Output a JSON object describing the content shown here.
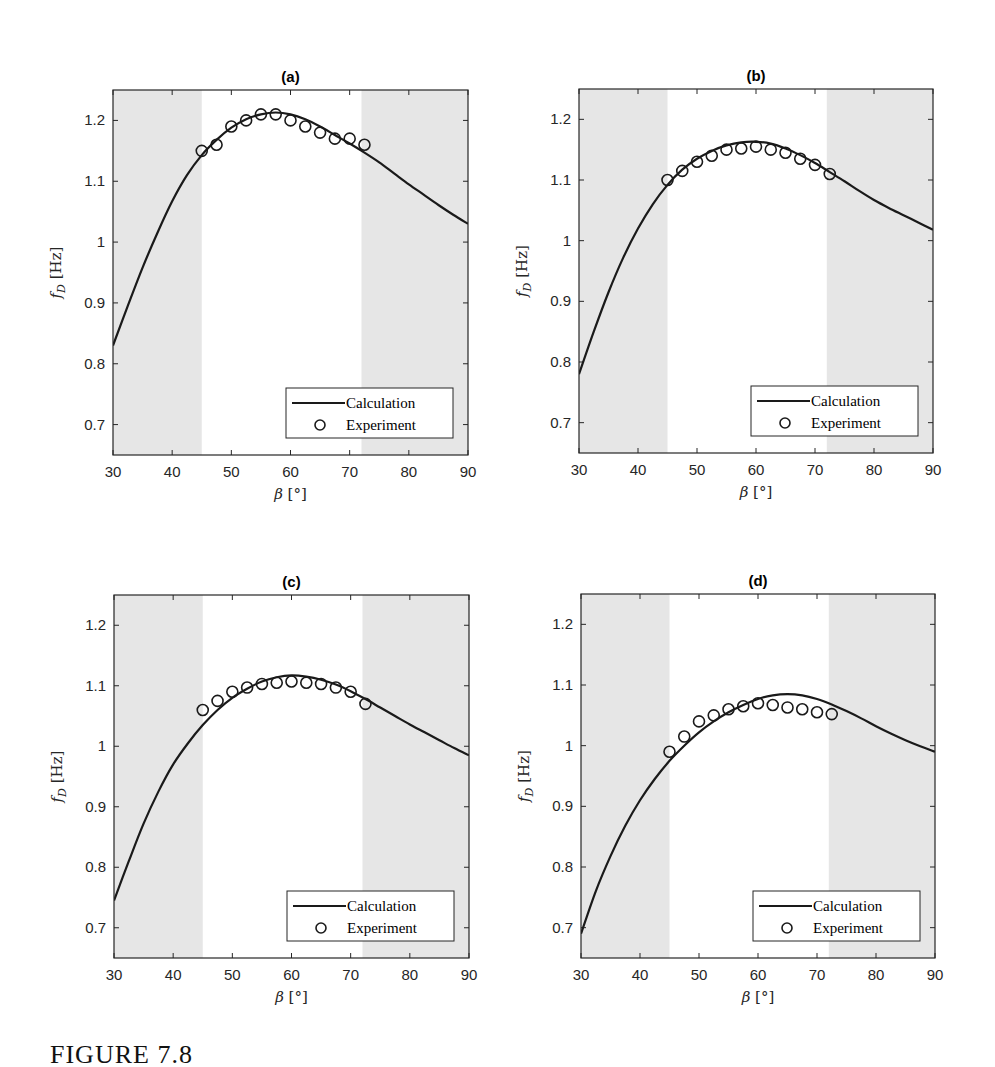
{
  "figure": {
    "caption": "FIGURE 7.8",
    "shade_color": "#e6e6e6",
    "line_color": "#1a1a1a",
    "axis_color": "#262626"
  },
  "chart_data": [
    {
      "type": "line",
      "title": "(a)",
      "xlabel": "β [°]",
      "ylabel": "f_D [Hz]",
      "xlim": [
        30,
        90
      ],
      "ylim": [
        0.65,
        1.25
      ],
      "xticks": [
        30,
        40,
        50,
        60,
        70,
        80,
        90
      ],
      "yticks": [
        0.7,
        0.8,
        0.9,
        1,
        1.1,
        1.2
      ],
      "ytick_labels": [
        "0.7",
        "0.8",
        "0.9",
        "1",
        "1.1",
        "1.2"
      ],
      "shaded_regions": [
        [
          30,
          45
        ],
        [
          72,
          90
        ]
      ],
      "legend": {
        "position": "lower right",
        "entries": [
          "Calculation",
          "Experiment"
        ]
      },
      "box": {
        "left": 113,
        "top": 90,
        "right": 468,
        "bottom": 455
      },
      "series": [
        {
          "name": "Calculation",
          "style": "line",
          "x": [
            30,
            32.5,
            35,
            37.5,
            40,
            42.5,
            45,
            47.5,
            50,
            52.5,
            55,
            57.5,
            60,
            62.5,
            65,
            67.5,
            70,
            72.5,
            75,
            77.5,
            80,
            82.5,
            85,
            87.5,
            90
          ],
          "y": [
            0.83,
            0.895,
            0.958,
            1.015,
            1.067,
            1.11,
            1.143,
            1.168,
            1.188,
            1.202,
            1.21,
            1.213,
            1.21,
            1.202,
            1.19,
            1.176,
            1.162,
            1.147,
            1.131,
            1.113,
            1.095,
            1.078,
            1.061,
            1.045,
            1.03
          ]
        },
        {
          "name": "Experiment",
          "style": "marker-circle",
          "x": [
            45,
            47.5,
            50,
            52.5,
            55,
            57.5,
            60,
            62.5,
            65,
            67.5,
            70,
            72.5
          ],
          "y": [
            1.15,
            1.16,
            1.19,
            1.2,
            1.21,
            1.21,
            1.2,
            1.19,
            1.18,
            1.17,
            1.17,
            1.16
          ]
        }
      ]
    },
    {
      "type": "line",
      "title": "(b)",
      "xlabel": "β [°]",
      "ylabel": "f_D [Hz]",
      "xlim": [
        30,
        90
      ],
      "ylim": [
        0.65,
        1.25
      ],
      "xticks": [
        30,
        40,
        50,
        60,
        70,
        80,
        90
      ],
      "yticks": [
        0.7,
        0.8,
        0.9,
        1,
        1.1,
        1.2
      ],
      "ytick_labels": [
        "0.7",
        "0.8",
        "0.9",
        "1",
        "1.1",
        "1.2"
      ],
      "shaded_regions": [
        [
          30,
          45
        ],
        [
          72,
          90
        ]
      ],
      "legend": {
        "position": "lower right",
        "entries": [
          "Calculation",
          "Experiment"
        ]
      },
      "box": {
        "left": 579,
        "top": 89,
        "right": 933,
        "bottom": 453
      },
      "series": [
        {
          "name": "Calculation",
          "style": "line",
          "x": [
            30,
            32.5,
            35,
            37.5,
            40,
            42.5,
            45,
            47.5,
            50,
            52.5,
            55,
            57.5,
            60,
            62.5,
            65,
            67.5,
            70,
            72.5,
            75,
            77.5,
            80,
            82.5,
            85,
            87.5,
            90
          ],
          "y": [
            0.78,
            0.85,
            0.915,
            0.972,
            1.02,
            1.06,
            1.092,
            1.117,
            1.135,
            1.148,
            1.157,
            1.162,
            1.163,
            1.16,
            1.152,
            1.141,
            1.128,
            1.113,
            1.098,
            1.082,
            1.067,
            1.054,
            1.042,
            1.03,
            1.018
          ]
        },
        {
          "name": "Experiment",
          "style": "marker-circle",
          "x": [
            45,
            47.5,
            50,
            52.5,
            55,
            57.5,
            60,
            62.5,
            65,
            67.5,
            70,
            72.5
          ],
          "y": [
            1.1,
            1.115,
            1.13,
            1.14,
            1.15,
            1.152,
            1.155,
            1.15,
            1.145,
            1.135,
            1.125,
            1.11
          ]
        }
      ]
    },
    {
      "type": "line",
      "title": "(c)",
      "xlabel": "β [°]",
      "ylabel": "f_D [Hz]",
      "xlim": [
        30,
        90
      ],
      "ylim": [
        0.65,
        1.25
      ],
      "xticks": [
        30,
        40,
        50,
        60,
        70,
        80,
        90
      ],
      "yticks": [
        0.7,
        0.8,
        0.9,
        1,
        1.1,
        1.2
      ],
      "ytick_labels": [
        "0.7",
        "0.8",
        "0.9",
        "1",
        "1.1",
        "1.2"
      ],
      "shaded_regions": [
        [
          30,
          45
        ],
        [
          72,
          90
        ]
      ],
      "legend": {
        "position": "lower right",
        "entries": [
          "Calculation",
          "Experiment"
        ]
      },
      "box": {
        "left": 114,
        "top": 595,
        "right": 469,
        "bottom": 958
      },
      "series": [
        {
          "name": "Calculation",
          "style": "line",
          "x": [
            30,
            32.5,
            35,
            37.5,
            40,
            42.5,
            45,
            47.5,
            50,
            52.5,
            55,
            57.5,
            60,
            62.5,
            65,
            67.5,
            70,
            72.5,
            75,
            77.5,
            80,
            82.5,
            85,
            87.5,
            90
          ],
          "y": [
            0.745,
            0.81,
            0.872,
            0.925,
            0.97,
            1.005,
            1.035,
            1.06,
            1.08,
            1.095,
            1.107,
            1.114,
            1.117,
            1.115,
            1.11,
            1.102,
            1.091,
            1.078,
            1.064,
            1.05,
            1.036,
            1.023,
            1.01,
            0.997,
            0.985
          ]
        },
        {
          "name": "Experiment",
          "style": "marker-circle",
          "x": [
            45,
            47.5,
            50,
            52.5,
            55,
            57.5,
            60,
            62.5,
            65,
            67.5,
            70,
            72.5
          ],
          "y": [
            1.06,
            1.075,
            1.09,
            1.097,
            1.103,
            1.105,
            1.107,
            1.105,
            1.103,
            1.097,
            1.09,
            1.07
          ]
        }
      ]
    },
    {
      "type": "line",
      "title": "(d)",
      "xlabel": "β [°]",
      "ylabel": "f_D [Hz]",
      "xlim": [
        30,
        90
      ],
      "ylim": [
        0.65,
        1.25
      ],
      "xticks": [
        30,
        40,
        50,
        60,
        70,
        80,
        90
      ],
      "yticks": [
        0.7,
        0.8,
        0.9,
        1,
        1.1,
        1.2
      ],
      "ytick_labels": [
        "0.7",
        "0.8",
        "0.9",
        "1",
        "1.1",
        "1.2"
      ],
      "shaded_regions": [
        [
          30,
          45
        ],
        [
          72,
          90
        ]
      ],
      "legend": {
        "position": "lower right",
        "entries": [
          "Calculation",
          "Experiment"
        ]
      },
      "box": {
        "left": 581,
        "top": 594,
        "right": 935,
        "bottom": 958
      },
      "series": [
        {
          "name": "Calculation",
          "style": "line",
          "x": [
            30,
            32.5,
            35,
            37.5,
            40,
            42.5,
            45,
            47.5,
            50,
            52.5,
            55,
            57.5,
            60,
            62.5,
            65,
            67.5,
            70,
            72.5,
            75,
            77.5,
            80,
            82.5,
            85,
            87.5,
            90
          ],
          "y": [
            0.69,
            0.76,
            0.818,
            0.868,
            0.91,
            0.945,
            0.975,
            1.0,
            1.022,
            1.04,
            1.055,
            1.067,
            1.077,
            1.083,
            1.085,
            1.083,
            1.077,
            1.068,
            1.057,
            1.045,
            1.032,
            1.02,
            1.009,
            0.999,
            0.99
          ]
        },
        {
          "name": "Experiment",
          "style": "marker-circle",
          "x": [
            45,
            47.5,
            50,
            52.5,
            55,
            57.5,
            60,
            62.5,
            65,
            67.5,
            70,
            72.5
          ],
          "y": [
            0.99,
            1.015,
            1.04,
            1.05,
            1.06,
            1.065,
            1.07,
            1.067,
            1.063,
            1.06,
            1.055,
            1.052
          ]
        }
      ]
    }
  ]
}
